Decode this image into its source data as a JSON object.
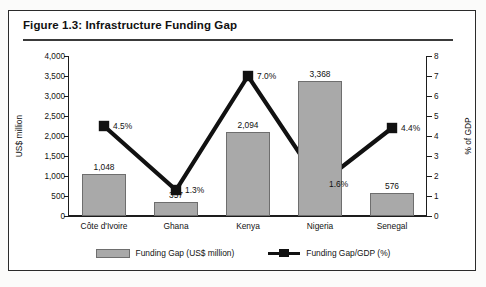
{
  "figure": {
    "title": "Figure 1.3: Infrastructure Funding Gap"
  },
  "legend": {
    "bar_label": "Funding Gap (US$ million)",
    "line_label": "Funding Gap/GDP (%)"
  },
  "colors": {
    "bar_fill": "#a9a9a9",
    "bar_stroke": "#6e6e6e",
    "line": "#111111",
    "axis": "#1d1d1d",
    "frame": "#2b2b2b"
  },
  "chart_data": {
    "type": "bar",
    "title": "Figure 1.3: Infrastructure Funding Gap",
    "categories": [
      "Côte d'Ivoire",
      "Ghana",
      "Kenya",
      "Nigeria",
      "Senegal"
    ],
    "xlabel": "",
    "series": [
      {
        "name": "Funding Gap (US$ million)",
        "type": "bar",
        "axis": "left",
        "values": [
          1048,
          357,
          2094,
          3368,
          576
        ],
        "value_labels": [
          "1,048",
          "357",
          "2,094",
          "3,368",
          "576"
        ]
      },
      {
        "name": "Funding Gap/GDP (%)",
        "type": "line",
        "axis": "right",
        "values": [
          4.5,
          1.3,
          7.0,
          1.6,
          4.4
        ],
        "value_labels": [
          "4.5%",
          "1.3%",
          "7.0%",
          "1.6%",
          "4.4%"
        ]
      }
    ],
    "left_axis": {
      "label": "US$ million",
      "ylim": [
        0,
        4000
      ],
      "ticks": [
        0,
        500,
        1000,
        1500,
        2000,
        2500,
        3000,
        3500,
        4000
      ],
      "tick_labels": [
        "0",
        "500",
        "1,000",
        "1,500",
        "2,000",
        "2,500",
        "3,000",
        "3,500",
        "4,000"
      ]
    },
    "right_axis": {
      "label": "% of GDP",
      "ylim": [
        0,
        8
      ],
      "ticks": [
        0,
        1,
        2,
        3,
        4,
        5,
        6,
        7,
        8
      ],
      "tick_labels": [
        "0",
        "1",
        "2",
        "3",
        "4",
        "5",
        "6",
        "7",
        "8"
      ]
    },
    "grid": false,
    "legend_position": "bottom"
  }
}
